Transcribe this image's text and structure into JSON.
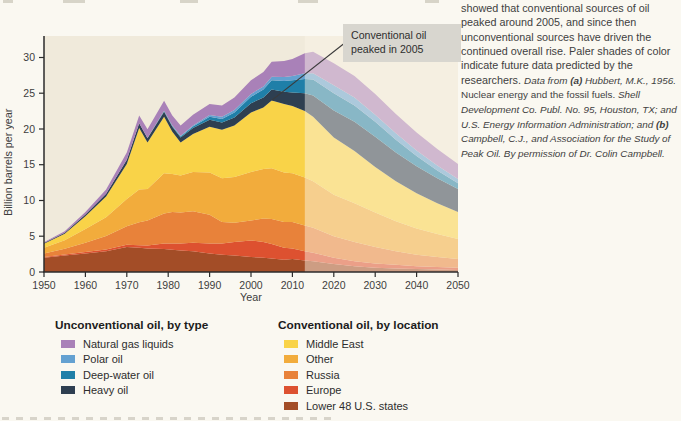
{
  "chart_data": {
    "type": "area",
    "stacked": true,
    "xlabel": "Year",
    "ylabel": "Billion barrels per year",
    "xlim": [
      1950,
      2050
    ],
    "ylim": [
      0,
      33
    ],
    "x_ticks": [
      1950,
      1960,
      1970,
      1980,
      1990,
      2000,
      2010,
      2020,
      2030,
      2040,
      2050
    ],
    "y_ticks": [
      0,
      5,
      10,
      15,
      20,
      25,
      30
    ],
    "grid": false,
    "plot_bg": "#F0EADB",
    "future_start_year": 2013,
    "future_note": "Paler shades of color indicate future data predicted by the researchers",
    "x": [
      1950,
      1955,
      1960,
      1965,
      1970,
      1973,
      1975,
      1979,
      1981,
      1983,
      1986,
      1990,
      1993,
      1996,
      2000,
      2003,
      2005,
      2008,
      2010,
      2013,
      2015,
      2020,
      2025,
      2030,
      2035,
      2040,
      2045,
      2050
    ],
    "series": [
      {
        "id": "lower48",
        "name": "Lower 48 U.S. states",
        "group": "conventional",
        "color": "#A34D27",
        "values": [
          2.0,
          2.3,
          2.6,
          2.9,
          3.5,
          3.4,
          3.3,
          3.2,
          3.1,
          3.0,
          2.9,
          2.6,
          2.4,
          2.3,
          2.1,
          2.0,
          1.9,
          1.7,
          1.8,
          1.6,
          1.5,
          1.1,
          0.8,
          0.6,
          0.5,
          0.4,
          0.35,
          0.3
        ]
      },
      {
        "id": "europe",
        "name": "Europe",
        "group": "conventional",
        "color": "#DD5130",
        "values": [
          0.1,
          0.15,
          0.2,
          0.25,
          0.3,
          0.35,
          0.4,
          0.8,
          0.9,
          1.0,
          1.2,
          1.4,
          1.6,
          1.9,
          2.3,
          2.2,
          2.0,
          1.7,
          1.5,
          1.3,
          1.2,
          0.9,
          0.7,
          0.6,
          0.5,
          0.4,
          0.35,
          0.3
        ]
      },
      {
        "id": "russia",
        "name": "Russia",
        "group": "conventional",
        "color": "#E8823A",
        "values": [
          0.5,
          0.8,
          1.3,
          1.9,
          2.6,
          3.2,
          3.5,
          4.2,
          4.4,
          4.3,
          4.4,
          4.0,
          3.0,
          2.7,
          2.8,
          3.3,
          3.5,
          3.6,
          3.7,
          3.6,
          3.5,
          3.0,
          2.7,
          2.3,
          1.9,
          1.6,
          1.4,
          1.2
        ]
      },
      {
        "id": "other",
        "name": "Other",
        "group": "conventional",
        "color": "#F2AC3C",
        "values": [
          0.8,
          1.2,
          1.9,
          2.6,
          3.8,
          4.6,
          4.4,
          5.6,
          5.3,
          5.2,
          5.5,
          5.9,
          6.1,
          6.4,
          6.8,
          6.9,
          7.1,
          6.9,
          6.8,
          6.7,
          6.5,
          5.8,
          5.4,
          4.8,
          4.2,
          3.7,
          3.2,
          2.8
        ]
      },
      {
        "id": "middle-east",
        "name": "Middle East",
        "group": "conventional",
        "color": "#F9D348",
        "values": [
          0.55,
          0.9,
          1.8,
          2.9,
          4.9,
          8.6,
          6.5,
          7.9,
          5.9,
          4.6,
          5.3,
          6.4,
          6.8,
          7.2,
          8.3,
          8.6,
          9.5,
          9.6,
          9.4,
          9.3,
          9.0,
          8.0,
          7.3,
          6.4,
          5.6,
          4.9,
          4.3,
          3.8
        ]
      },
      {
        "id": "heavy",
        "name": "Heavy oil",
        "group": "unconventional",
        "color": "#2E3F51",
        "values": [
          0.1,
          0.15,
          0.25,
          0.4,
          0.6,
          0.65,
          0.6,
          0.7,
          0.7,
          0.7,
          0.85,
          1.0,
          1.0,
          1.1,
          1.3,
          1.4,
          1.5,
          1.7,
          1.9,
          2.5,
          3.0,
          3.8,
          4.1,
          4.2,
          4.0,
          3.8,
          3.5,
          3.2
        ]
      },
      {
        "id": "deep-water",
        "name": "Deep-water oil",
        "group": "unconventional",
        "color": "#1F7FA8",
        "values": [
          0,
          0,
          0,
          0,
          0,
          0,
          0.05,
          0.1,
          0.12,
          0.15,
          0.2,
          0.4,
          0.5,
          0.7,
          0.9,
          1.1,
          1.3,
          1.5,
          1.7,
          2.0,
          2.2,
          2.4,
          2.3,
          2.1,
          1.8,
          1.4,
          1.1,
          0.8
        ]
      },
      {
        "id": "polar",
        "name": "Polar oil",
        "group": "unconventional",
        "color": "#64A1D1",
        "values": [
          0,
          0,
          0,
          0,
          0,
          0,
          0,
          0.05,
          0.08,
          0.1,
          0.15,
          0.25,
          0.3,
          0.35,
          0.4,
          0.45,
          0.5,
          0.55,
          0.6,
          0.8,
          0.9,
          1.1,
          1.1,
          1.0,
          0.9,
          0.8,
          0.7,
          0.6
        ]
      },
      {
        "id": "ngl",
        "name": "Natural gas liquids",
        "group": "unconventional",
        "color": "#A981B8",
        "values": [
          0.12,
          0.2,
          0.35,
          0.6,
          1.0,
          1.1,
          1.2,
          1.4,
          1.4,
          1.45,
          1.5,
          1.55,
          1.6,
          1.75,
          1.9,
          2.0,
          2.1,
          2.25,
          2.4,
          2.8,
          3.0,
          3.1,
          3.0,
          2.9,
          2.7,
          2.5,
          2.3,
          2.1
        ]
      }
    ],
    "annotation": {
      "text": "Conventional oil peaked in 2005",
      "target_year": 2005,
      "target_value": 24,
      "box_bg": "#D8D6CF"
    }
  },
  "legend": {
    "unconventional": {
      "title": "Unconventional oil, by type",
      "items": [
        {
          "label": "Natural gas liquids",
          "color": "#A981B8"
        },
        {
          "label": "Polar oil",
          "color": "#64A1D1"
        },
        {
          "label": "Deep-water oil",
          "color": "#1F7FA8"
        },
        {
          "label": "Heavy oil",
          "color": "#2E3F51"
        }
      ]
    },
    "conventional": {
      "title": "Conventional oil, by location",
      "items": [
        {
          "label": "Middle East",
          "color": "#F9D348"
        },
        {
          "label": "Other",
          "color": "#F2AC3C"
        },
        {
          "label": "Russia",
          "color": "#E8823A"
        },
        {
          "label": "Europe",
          "color": "#DD5130"
        },
        {
          "label": "Lower 48 U.S. states",
          "color": "#A34D27"
        }
      ]
    }
  },
  "caption": {
    "body": "showed that conventional sources of oil peaked around 2005, and since then unconventional sources have driven the continued overall rise. Paler shades of color indicate future data predicted by the researchers. ",
    "cite1": "Data from ",
    "cite_a": "(a)",
    "cite2": " Hubbert, M.K., 1956. ",
    "cite3": "Nuclear energy and the fossil fuels. ",
    "cite4": "Shell Development Co. Publ. No. 95, Houston, TX; and U.S. Energy Information Administration; and ",
    "cite_b": "(b)",
    "cite5": " Campbell, C.J., and Association for the Study of Peak Oil. By permission of Dr. Colin Campbell."
  }
}
